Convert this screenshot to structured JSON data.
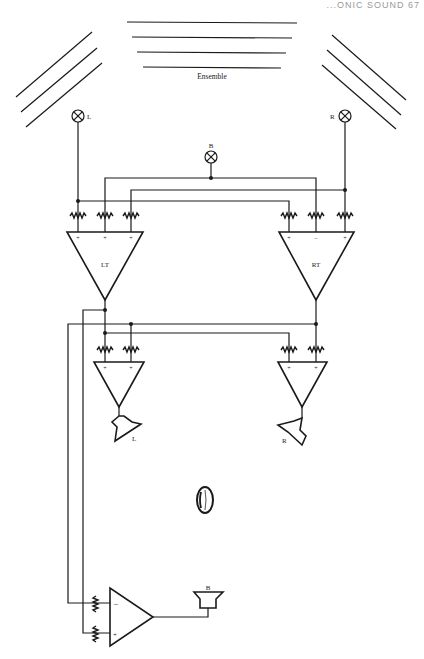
{
  "page_header": "...ONIC SOUND 67",
  "figure": {
    "ensemble_label": "Ensemble",
    "microphones": [
      {
        "id": "L",
        "label": "L"
      },
      {
        "id": "R",
        "label": "R"
      },
      {
        "id": "B",
        "label": "B"
      }
    ],
    "mixing_amplifiers": [
      {
        "id": "LT",
        "label": "LT",
        "inputs": [
          "+",
          "+",
          "+"
        ]
      },
      {
        "id": "RT",
        "label": "RT",
        "inputs": [
          "+",
          "–",
          "+"
        ]
      }
    ],
    "output_amplifiers": [
      {
        "id": "left-out",
        "inputs": [
          "+",
          "+"
        ],
        "speaker_label": "L"
      },
      {
        "id": "right-out",
        "inputs": [
          "+",
          "+"
        ],
        "speaker_label": "R"
      },
      {
        "id": "bass-out",
        "inputs": [
          "–",
          "+"
        ],
        "speaker_label": "B"
      }
    ],
    "listener": "listener-head"
  }
}
